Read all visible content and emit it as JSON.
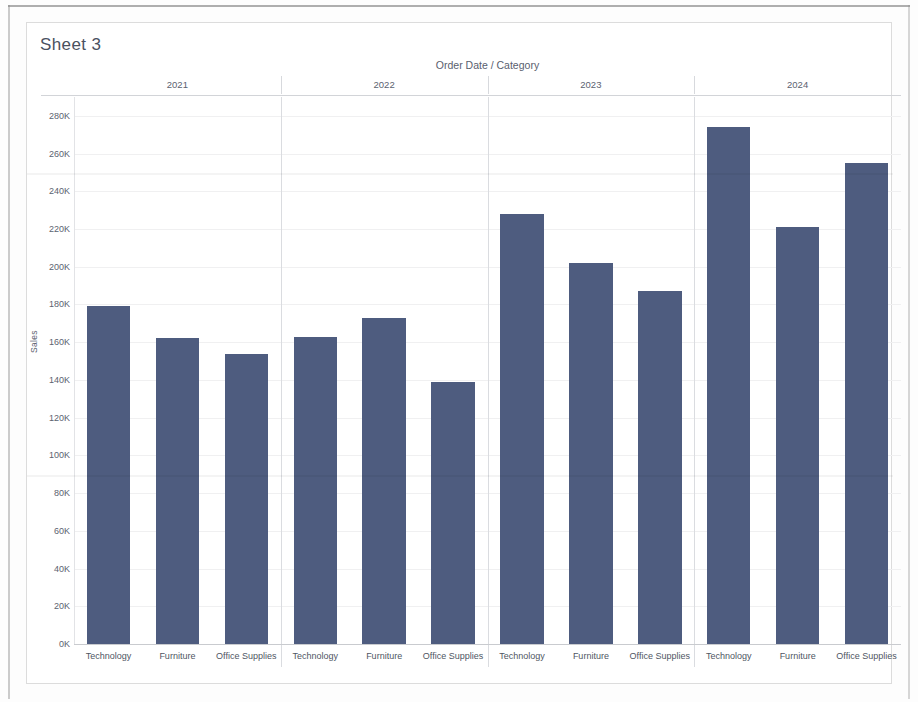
{
  "worksheet": {
    "title": "Sheet 3"
  },
  "chart_data": {
    "type": "bar",
    "title": "Order Date / Category",
    "xlabel": "Order Date / Category",
    "ylabel": "Sales",
    "ylim": [
      0,
      290000
    ],
    "grid": true,
    "legend": "none",
    "bar_color": "#4e5c7f",
    "y_tick_labels": [
      "280K",
      "260K",
      "240K",
      "220K",
      "200K",
      "180K",
      "160K",
      "140K",
      "120K",
      "100K",
      "80K",
      "60K",
      "40K",
      "20K",
      "0K"
    ],
    "y_tick_values": [
      280000,
      260000,
      240000,
      220000,
      200000,
      180000,
      160000,
      140000,
      120000,
      100000,
      80000,
      60000,
      40000,
      20000,
      0
    ],
    "groups": [
      "2021",
      "2022",
      "2023",
      "2024"
    ],
    "categories": [
      "Technology",
      "Furniture",
      "Office Supplies"
    ],
    "series": [
      {
        "name": "2021",
        "values": [
          179000,
          162000,
          154000
        ]
      },
      {
        "name": "2022",
        "values": [
          163000,
          173000,
          139000
        ]
      },
      {
        "name": "2023",
        "values": [
          228000,
          202000,
          187000
        ]
      },
      {
        "name": "2024",
        "values": [
          274000,
          221000,
          255000
        ]
      }
    ]
  }
}
